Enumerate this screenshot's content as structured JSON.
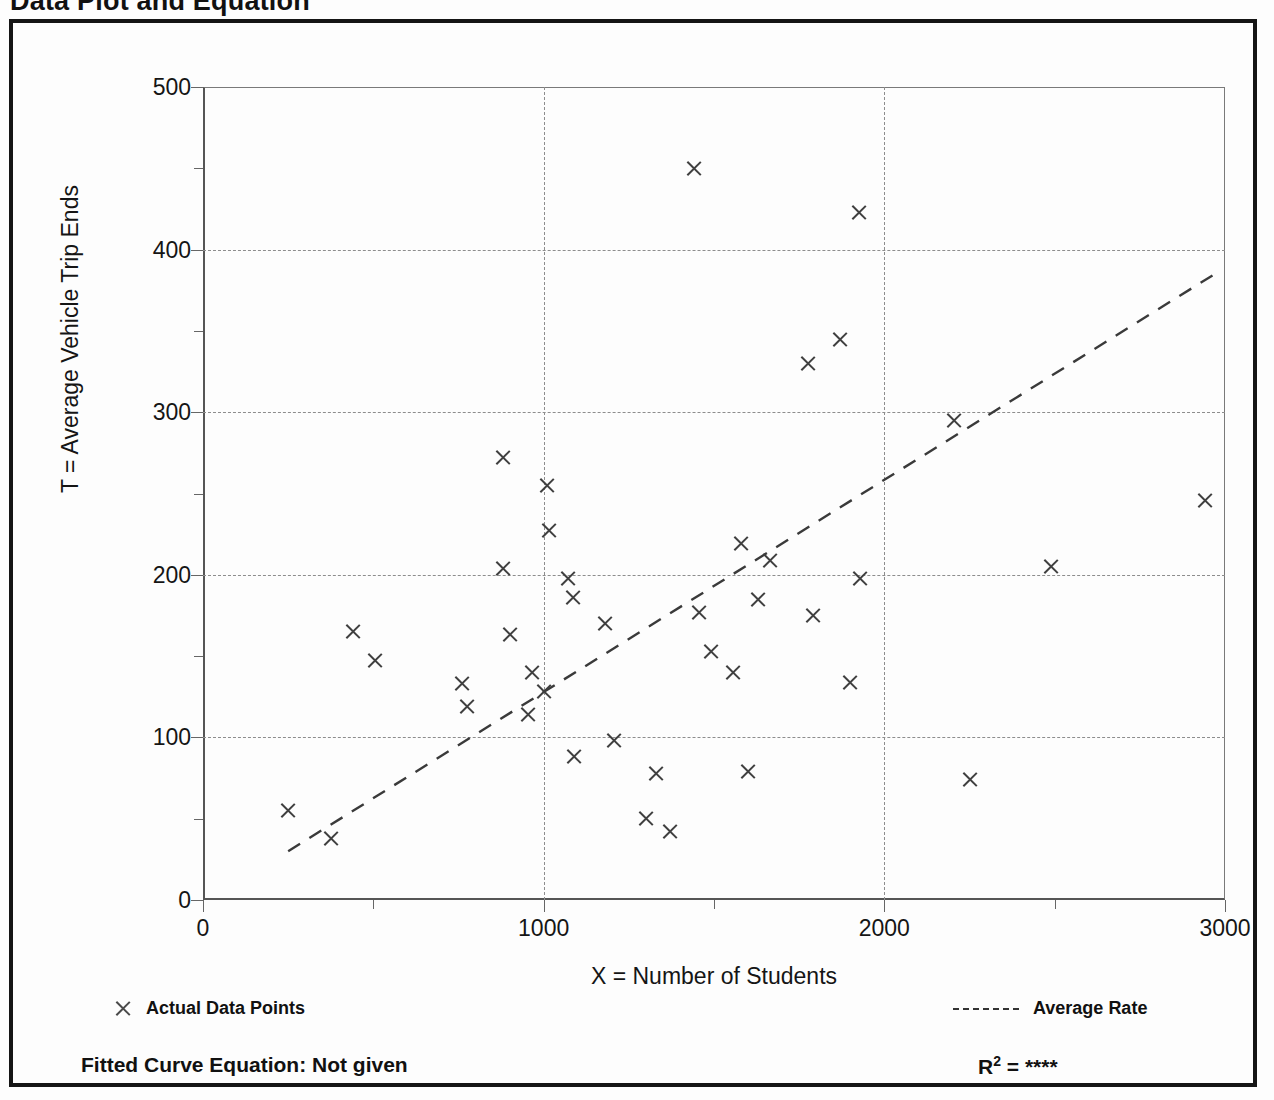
{
  "figure": {
    "title": "Data Plot and Equation",
    "fitted_curve_label": "Fitted Curve Equation:  Not given",
    "r2_prefix": "R",
    "r2_exponent": "2",
    "r2_equals": " = ",
    "r2_value": "****"
  },
  "legend": {
    "points_label": "Actual Data Points",
    "rate_label": "Average Rate",
    "point_icon": "x-marker-icon",
    "rate_icon": "dashed-line-icon"
  },
  "chart_data": {
    "type": "scatter",
    "title": "Data Plot and Equation",
    "xlabel": "X = Number of Students",
    "ylabel": "T = Average Vehicle Trip Ends",
    "xlim": [
      0,
      3000
    ],
    "ylim": [
      0,
      500
    ],
    "grid": true,
    "legend_position": "below-plot",
    "x_major_ticks": [
      0,
      1000,
      2000,
      3000
    ],
    "x_minor_ticks": [
      500,
      1500,
      2500
    ],
    "x_tick_labels": [
      "0",
      "1000",
      "2000",
      "3000"
    ],
    "y_major_ticks": [
      0,
      100,
      200,
      300,
      400,
      500
    ],
    "y_minor_ticks": [
      50,
      150,
      250,
      350,
      450
    ],
    "y_tick_labels": [
      "0",
      "100",
      "200",
      "300",
      "400",
      "500"
    ],
    "series": [
      {
        "name": "Actual Data Points",
        "marker": "x",
        "points": [
          [
            250,
            55
          ],
          [
            375,
            38
          ],
          [
            440,
            165
          ],
          [
            505,
            147
          ],
          [
            760,
            133
          ],
          [
            775,
            119
          ],
          [
            880,
            272
          ],
          [
            880,
            204
          ],
          [
            900,
            163
          ],
          [
            955,
            114
          ],
          [
            965,
            140
          ],
          [
            1000,
            128
          ],
          [
            1010,
            255
          ],
          [
            1015,
            227
          ],
          [
            1070,
            198
          ],
          [
            1085,
            186
          ],
          [
            1090,
            88
          ],
          [
            1180,
            170
          ],
          [
            1205,
            98
          ],
          [
            1300,
            50
          ],
          [
            1330,
            78
          ],
          [
            1370,
            42
          ],
          [
            1440,
            450
          ],
          [
            1455,
            177
          ],
          [
            1490,
            153
          ],
          [
            1555,
            140
          ],
          [
            1580,
            219
          ],
          [
            1600,
            79
          ],
          [
            1630,
            185
          ],
          [
            1665,
            209
          ],
          [
            1775,
            330
          ],
          [
            1790,
            175
          ],
          [
            1870,
            345
          ],
          [
            1900,
            134
          ],
          [
            1925,
            423
          ],
          [
            1930,
            198
          ],
          [
            2205,
            295
          ],
          [
            2250,
            74
          ],
          [
            2490,
            205
          ],
          [
            2940,
            246
          ]
        ]
      },
      {
        "name": "Average Rate",
        "type": "line",
        "style": "dashed",
        "endpoints": [
          [
            250,
            30
          ],
          [
            2970,
            385
          ]
        ]
      }
    ]
  }
}
